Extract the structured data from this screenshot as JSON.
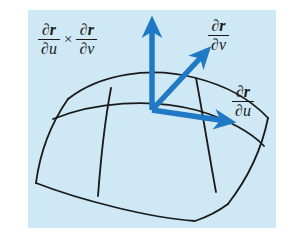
{
  "figure": {
    "background_color": "#ffffff",
    "panel_color": "#cfe8f5",
    "curve_color": "#1a1a1a",
    "vector_color": "#2079c4",
    "label_color": "#1a1a1a"
  },
  "labels": {
    "normal": {
      "name": "cross-product-label",
      "partial_symbol": "∂",
      "numerator_var": "r",
      "denominator_first": "u",
      "denominator_second": "v",
      "operator": "×",
      "text": "∂r/∂u × ∂r/∂v"
    },
    "dv": {
      "name": "partial-r-partial-v-label",
      "partial_symbol": "∂",
      "numerator_var": "r",
      "denominator": "v",
      "text": "∂r/∂v"
    },
    "du": {
      "name": "partial-r-partial-u-label",
      "partial_symbol": "∂",
      "numerator_var": "r",
      "denominator": "u",
      "text": "∂r/∂u"
    }
  },
  "vectors": [
    {
      "name": "normal-vector-arrow",
      "label": "∂r/∂u × ∂r/∂v",
      "origin": [
        152,
        110
      ],
      "tip": [
        152,
        22
      ],
      "color": "#2079c4",
      "width": 5.5
    },
    {
      "name": "tangent-vector-v-arrow",
      "label": "∂r/∂v",
      "origin": [
        152,
        110
      ],
      "tip": [
        207,
        50
      ],
      "color": "#2079c4",
      "width": 5.5
    },
    {
      "name": "tangent-vector-u-arrow",
      "label": "∂r/∂u",
      "origin": [
        152,
        110
      ],
      "tip": [
        230,
        122
      ],
      "color": "#2079c4",
      "width": 5.5
    }
  ],
  "surface": {
    "name": "parametric-surface-patch",
    "description": "curved dome-shaped surface patch with u and v grid curves",
    "stroke_color": "#1a1a1a",
    "stroke_width": 1.8,
    "curves": [
      {
        "name": "surface-top-ridge-curve",
        "path": "M 68,99 C 100,74 150,66 196,78 C 228,86 252,101 268,118"
      },
      {
        "name": "surface-left-edge-curve",
        "path": "M 68,99 C 52,122 40,152 36,183"
      },
      {
        "name": "surface-right-edge-curve",
        "path": "M 268,118 C 262,148 248,178 228,204"
      },
      {
        "name": "surface-bottom-boundary-curve",
        "path": "M 36,183 C 80,200 150,218 195,221 C 210,216 220,210 228,204"
      },
      {
        "name": "surface-v-grid-curve-upper",
        "path": "M 53,119 C 95,102 150,98 196,110 C 228,119 252,133 264,146"
      },
      {
        "name": "surface-u-grid-curve-left",
        "path": "M 111,88 C 105,120 101,155 98,196"
      },
      {
        "name": "surface-u-grid-curve-right",
        "path": "M 196,78 C 202,110 208,148 216,192"
      }
    ]
  }
}
